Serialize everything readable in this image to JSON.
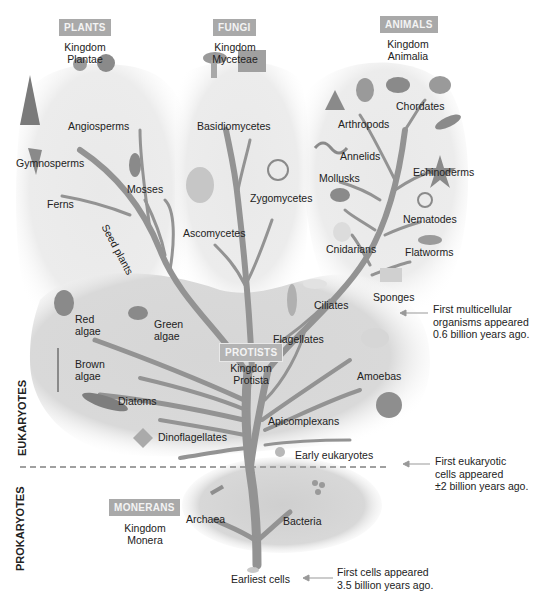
{
  "kingdoms": {
    "plants": {
      "badge": "PLANTS",
      "line1": "Kingdom",
      "line2": "Plantae"
    },
    "fungi": {
      "badge": "FUNGI",
      "line1": "Kingdom",
      "line2": "Myceteae"
    },
    "animals": {
      "badge": "ANIMALS",
      "line1": "Kingdom",
      "line2": "Animalia"
    },
    "protists": {
      "badge": "PROTISTS",
      "line1": "Kingdom",
      "line2": "Protista"
    },
    "monerans": {
      "badge": "MONERANS",
      "line1": "Kingdom",
      "line2": "Monera"
    }
  },
  "groups": {
    "plants": [
      "Angiosperms",
      "Gymnosperms",
      "Mosses",
      "Ferns",
      "Seed plants"
    ],
    "fungi": [
      "Basidiomycetes",
      "Zygomycetes",
      "Ascomycetes"
    ],
    "animals": [
      "Chordates",
      "Arthropods",
      "Annelids",
      "Echinoderms",
      "Mollusks",
      "Nematodes",
      "Cnidarians",
      "Flatworms",
      "Sponges"
    ],
    "protists": {
      "red_algae": [
        "Red",
        "algae"
      ],
      "green_algae": [
        "Green",
        "algae"
      ],
      "brown_algae": [
        "Brown",
        "algae"
      ],
      "others": [
        "Ciliates",
        "Flagellates",
        "Amoebas",
        "Diatoms",
        "Apicomplexans",
        "Dinoflagellates",
        "Early eukaryotes"
      ]
    },
    "monerans": [
      "Archaea",
      "Bacteria",
      "Earliest cells"
    ]
  },
  "domains": {
    "eukaryotes": "EUKARYOTES",
    "prokaryotes": "PROKARYOTES"
  },
  "notes": {
    "multicellular": [
      "First multicellular",
      "organisms appeared",
      "0.6 billion years ago."
    ],
    "eukaryotic": [
      "First eukaryotic",
      "cells appeared",
      "±2 billion years ago."
    ],
    "first_cells": [
      "First  cells appeared",
      "3.5 billion years ago."
    ]
  },
  "colors": {
    "branch": "#9a9a9a",
    "trunk": "#8e8e8e",
    "cloud": "#e6e6e6",
    "protist_cloud": "#d2d2d2",
    "badge": "#a9a9a9",
    "divider": "#a0a0a0"
  }
}
